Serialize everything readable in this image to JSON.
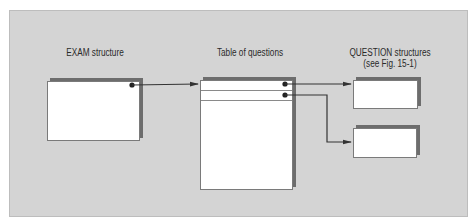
{
  "diagram": {
    "labels": {
      "exam": "EXAM structure",
      "table": "Table of questions",
      "question_line1": "QUESTION structures",
      "question_line2": "(see Fig. 15-1)"
    },
    "colors": {
      "background": "#d4d4d4",
      "box": "#ffffff",
      "arrow": "#333333"
    },
    "nodes": [
      "EXAM structure box",
      "Table of questions",
      "QUESTION structure 1",
      "QUESTION structure 2"
    ],
    "edges": [
      {
        "from": "EXAM structure box",
        "to": "Table of questions"
      },
      {
        "from": "Table of questions row 1",
        "to": "QUESTION structure 1"
      },
      {
        "from": "Table of questions row 2",
        "to": "QUESTION structure 2"
      }
    ]
  }
}
